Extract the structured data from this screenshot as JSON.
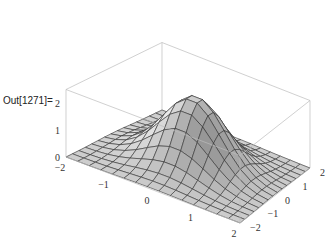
{
  "cell": {
    "out_label": "Out[1271]="
  },
  "chart_data": {
    "type": "surface3d",
    "title": "",
    "function": "2.5*exp(-(x^2+y^2))",
    "x_range": [
      -2,
      2
    ],
    "y_range": [
      -2,
      2
    ],
    "z_range": [
      0,
      2.5
    ],
    "mesh": 15,
    "x_ticks": [
      "-2",
      "-1",
      "0",
      "1",
      "2"
    ],
    "y_ticks": [
      "-2",
      "-1",
      "0",
      "1",
      "2"
    ],
    "z_ticks": [
      "0",
      "1",
      "2"
    ],
    "boxed": true,
    "colors": {
      "surface": "#d6d6d6",
      "mesh": "#333333",
      "box": "#bbbbbb"
    }
  }
}
